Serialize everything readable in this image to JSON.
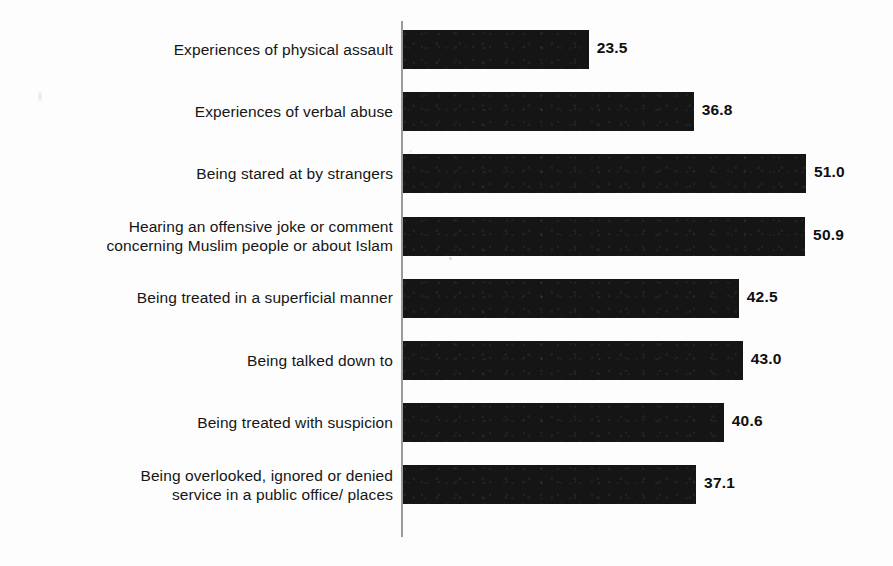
{
  "chart_data": {
    "type": "bar",
    "orientation": "horizontal",
    "title": "",
    "subtitle": "",
    "xlabel": "",
    "ylabel": "",
    "xlim": [
      0,
      55
    ],
    "grid": false,
    "legend": null,
    "bar_color": "#151515",
    "axis_color": "#9a9a9a",
    "background_color": "#ffffff",
    "value_label_format": "one-decimal",
    "categories": [
      "Experiences of physical assault",
      "Experiences of verbal abuse",
      "Being stared at by strangers",
      "Hearing an offensive joke or comment\nconcerning Muslim people or about Islam",
      "Being treated in a superficial manner",
      "Being talked down to",
      "Being treated with suspicion",
      "Being overlooked, ignored or denied\nservice in a public office/ places"
    ],
    "values": [
      23.5,
      36.8,
      51.0,
      50.9,
      42.5,
      43.0,
      40.6,
      37.1
    ],
    "value_labels": [
      "23.5",
      "36.8",
      "51.0",
      "50.9",
      "42.5",
      "43.0",
      "40.6",
      "37.1"
    ]
  }
}
